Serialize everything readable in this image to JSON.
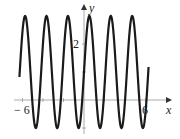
{
  "chart_data": {
    "type": "line",
    "title": "",
    "xlabel": "x",
    "ylabel": "y",
    "xlim": [
      -6.3,
      6.5
    ],
    "ylim": [
      -1,
      3
    ],
    "x_tick_labels": [
      "-6",
      "6"
    ],
    "y_tick_labels": [
      "2"
    ],
    "grid": false,
    "series": [
      {
        "name": "y = 1 + 2 sin(3x)",
        "description": "Sinusoid oscillating between -1 and 3 over x from about -6.3 to 6.3",
        "amplitude": 2,
        "vertical_shift": 1,
        "period_approx": 2.09,
        "max": 3,
        "min": -1
      }
    ]
  },
  "labels": {
    "x_axis": "x",
    "y_axis": "y",
    "x_min_tick": "− 6",
    "x_max_tick": "6",
    "y_tick": "2"
  },
  "colors": {
    "curve": "#1a1a1a",
    "axes": "#999999"
  }
}
